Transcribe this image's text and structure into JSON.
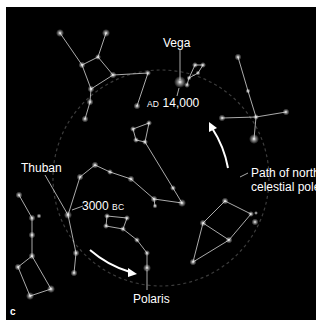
{
  "figure": {
    "panel_letter": "c",
    "background_color": "#000000",
    "star_color": "#ffffff",
    "line_color": "#d8d8d8",
    "path_circle_color": "#3a3a3a",
    "arrow_color": "#ffffff"
  },
  "labels": {
    "vega": "Vega",
    "thuban": "Thuban",
    "polaris": "Polaris",
    "ad_prefix": "AD",
    "ad_year": "14,000",
    "bc_year": "3000",
    "bc_suffix": "BC",
    "path_line1": "Path of north",
    "path_line2": "celestial pole"
  },
  "stars": {
    "vega": {
      "x": 180,
      "y": 82
    },
    "thuban": {
      "x": 68,
      "y": 215
    },
    "polaris": {
      "x": 147,
      "y": 268
    }
  }
}
